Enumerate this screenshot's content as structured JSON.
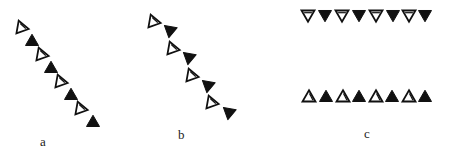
{
  "figure": {
    "panels": [
      {
        "label": "a",
        "label_pos": [
          40,
          134
        ],
        "description": "diagonal chain of alternating open and filled upward triangles",
        "triangles": [
          {
            "x": 21,
            "y": 27,
            "fill": "open",
            "dir": "up",
            "rot": -20
          },
          {
            "x": 32,
            "y": 41,
            "fill": "filled",
            "dir": "up",
            "rot": 0
          },
          {
            "x": 41,
            "y": 54,
            "fill": "open",
            "dir": "up",
            "rot": -20
          },
          {
            "x": 51,
            "y": 68,
            "fill": "filled",
            "dir": "up",
            "rot": 0
          },
          {
            "x": 60,
            "y": 81,
            "fill": "open",
            "dir": "up",
            "rot": -20
          },
          {
            "x": 71,
            "y": 95,
            "fill": "filled",
            "dir": "up",
            "rot": 0
          },
          {
            "x": 80,
            "y": 108,
            "fill": "open",
            "dir": "up",
            "rot": -20
          },
          {
            "x": 93,
            "y": 122,
            "fill": "filled",
            "dir": "up",
            "rot": 0
          }
        ]
      },
      {
        "label": "b",
        "label_pos": [
          178,
          127
        ],
        "description": "diagonal chain of pairs: open upward triangle followed by filled downward triangle",
        "triangles": [
          {
            "x": 153,
            "y": 21,
            "fill": "open",
            "dir": "up",
            "rot": -20
          },
          {
            "x": 170,
            "y": 31,
            "fill": "filled",
            "dir": "down",
            "rot": 10
          },
          {
            "x": 172,
            "y": 48,
            "fill": "open",
            "dir": "up",
            "rot": -20
          },
          {
            "x": 189,
            "y": 58,
            "fill": "filled",
            "dir": "down",
            "rot": 10
          },
          {
            "x": 191,
            "y": 75,
            "fill": "open",
            "dir": "up",
            "rot": -20
          },
          {
            "x": 208,
            "y": 86,
            "fill": "filled",
            "dir": "down",
            "rot": 10
          },
          {
            "x": 211,
            "y": 102,
            "fill": "open",
            "dir": "up",
            "rot": -20
          },
          {
            "x": 229,
            "y": 113,
            "fill": "filled",
            "dir": "down",
            "rot": 10
          }
        ]
      },
      {
        "label": "c",
        "label_pos": [
          364,
          126
        ],
        "description": "two horizontal rows: top row downward triangles, bottom row upward triangles, alternating open/filled",
        "triangles": [
          {
            "x": 308,
            "y": 15,
            "fill": "open",
            "dir": "down",
            "rot": 0
          },
          {
            "x": 325,
            "y": 15,
            "fill": "filled",
            "dir": "down",
            "rot": 0
          },
          {
            "x": 342,
            "y": 15,
            "fill": "open",
            "dir": "down",
            "rot": 0
          },
          {
            "x": 359,
            "y": 15,
            "fill": "filled",
            "dir": "down",
            "rot": 0
          },
          {
            "x": 376,
            "y": 15,
            "fill": "open",
            "dir": "down",
            "rot": 0
          },
          {
            "x": 393,
            "y": 15,
            "fill": "filled",
            "dir": "down",
            "rot": 0
          },
          {
            "x": 409,
            "y": 15,
            "fill": "open",
            "dir": "down",
            "rot": 0
          },
          {
            "x": 425,
            "y": 15,
            "fill": "filled",
            "dir": "down",
            "rot": 0
          },
          {
            "x": 309,
            "y": 97,
            "fill": "open",
            "dir": "up",
            "rot": 0
          },
          {
            "x": 326,
            "y": 97,
            "fill": "filled",
            "dir": "up",
            "rot": 0
          },
          {
            "x": 343,
            "y": 97,
            "fill": "open",
            "dir": "up",
            "rot": 0
          },
          {
            "x": 359,
            "y": 97,
            "fill": "filled",
            "dir": "up",
            "rot": 0
          },
          {
            "x": 376,
            "y": 97,
            "fill": "open",
            "dir": "up",
            "rot": 0
          },
          {
            "x": 392,
            "y": 97,
            "fill": "filled",
            "dir": "up",
            "rot": 0
          },
          {
            "x": 409,
            "y": 97,
            "fill": "open",
            "dir": "up",
            "rot": 0
          },
          {
            "x": 425,
            "y": 97,
            "fill": "filled",
            "dir": "up",
            "rot": 0
          }
        ]
      }
    ],
    "colors": {
      "ink": "#111111",
      "background": "#ffffff"
    },
    "triangle_size": 13
  }
}
